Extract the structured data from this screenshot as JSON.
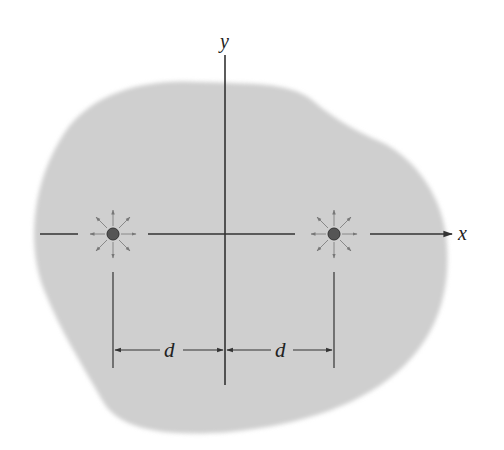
{
  "figure": {
    "type": "physics-diagram",
    "colors": {
      "background": "#ffffff",
      "region": "#cfcfcf",
      "axis": "#333333",
      "charge": "#555555",
      "field_arrow": "#777777"
    }
  },
  "axes": {
    "x_label": "x",
    "y_label": "y"
  },
  "charges": [
    {
      "name": "left-charge",
      "position": "-d"
    },
    {
      "name": "right-charge",
      "position": "+d"
    }
  ],
  "dimensions": [
    {
      "label": "d",
      "from": "left-charge",
      "to": "origin"
    },
    {
      "label": "d",
      "from": "origin",
      "to": "right-charge"
    }
  ]
}
